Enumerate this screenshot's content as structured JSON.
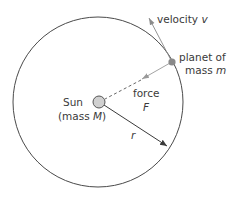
{
  "diagram": {
    "type": "orbital-mechanics",
    "labels": {
      "velocity": "velocity",
      "velocity_symbol": "v",
      "planet_line1": "planet of",
      "planet_line2_prefix": "mass",
      "planet_mass_symbol": "m",
      "force": "force",
      "force_symbol": "F",
      "sun": "Sun",
      "sun_mass_prefix": "(mass",
      "sun_mass_symbol": "M",
      "sun_mass_suffix": ")",
      "radius_symbol": "r"
    },
    "colors": {
      "orbit": "#4a4a4a",
      "sun_fill": "#d0d0d0",
      "sun_stroke": "#555555",
      "planet_fill": "#8a8a8a",
      "velocity_arrow": "#888888",
      "force_arrow": "#999999",
      "radius_arrow": "#3a3a3a",
      "text": "#3a3a3a"
    }
  }
}
